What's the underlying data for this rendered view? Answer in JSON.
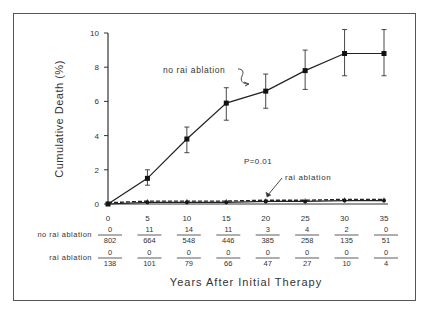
{
  "chart_data": {
    "type": "line",
    "title": "",
    "xlabel": "Years After Initial Therapy",
    "ylabel": "Cumulative Death (%)",
    "x": [
      0,
      5,
      10,
      15,
      20,
      25,
      30,
      35
    ],
    "x_ticks": [
      "0",
      "5",
      "10",
      "15",
      "20",
      "25",
      "30",
      "35"
    ],
    "y_ticks": [
      "0",
      "2",
      "4",
      "6",
      "8",
      "10"
    ],
    "xlim": [
      0,
      35
    ],
    "ylim": [
      0,
      10
    ],
    "grid": false,
    "legend_position": "inline annotations",
    "series": [
      {
        "name": "no rai ablation",
        "style": "solid line with square markers and error bars",
        "values": [
          0,
          1.5,
          3.8,
          5.9,
          6.6,
          7.8,
          8.8,
          8.8
        ],
        "error_low": [
          0,
          1.1,
          3.0,
          4.9,
          5.6,
          6.7,
          7.5,
          7.5
        ],
        "error_high": [
          0,
          2.0,
          4.5,
          6.8,
          7.6,
          9.0,
          10.2,
          10.2
        ]
      },
      {
        "name": "rai ablation",
        "style": "dashed line with markers",
        "values": [
          0,
          0.1,
          0.1,
          0.1,
          0.15,
          0.15,
          0.2,
          0.2
        ]
      }
    ],
    "annotations": [
      {
        "text": "no rai ablation",
        "points_to": "upper series"
      },
      {
        "text": "rai ablation",
        "points_to": "lower series at x=20"
      },
      {
        "text": "P=0.01"
      }
    ],
    "risk_table": {
      "rows": [
        {
          "label": "no rai ablation",
          "deaths": [
            "0",
            "11",
            "14",
            "11",
            "3",
            "4",
            "2",
            "0"
          ],
          "at_risk": [
            "802",
            "664",
            "548",
            "446",
            "385",
            "258",
            "135",
            "51"
          ]
        },
        {
          "label": "rai ablation",
          "deaths": [
            "0",
            "0",
            "0",
            "0",
            "0",
            "0",
            "0",
            "0"
          ],
          "at_risk": [
            "138",
            "101",
            "79",
            "66",
            "47",
            "27",
            "10",
            "4"
          ]
        }
      ]
    }
  }
}
